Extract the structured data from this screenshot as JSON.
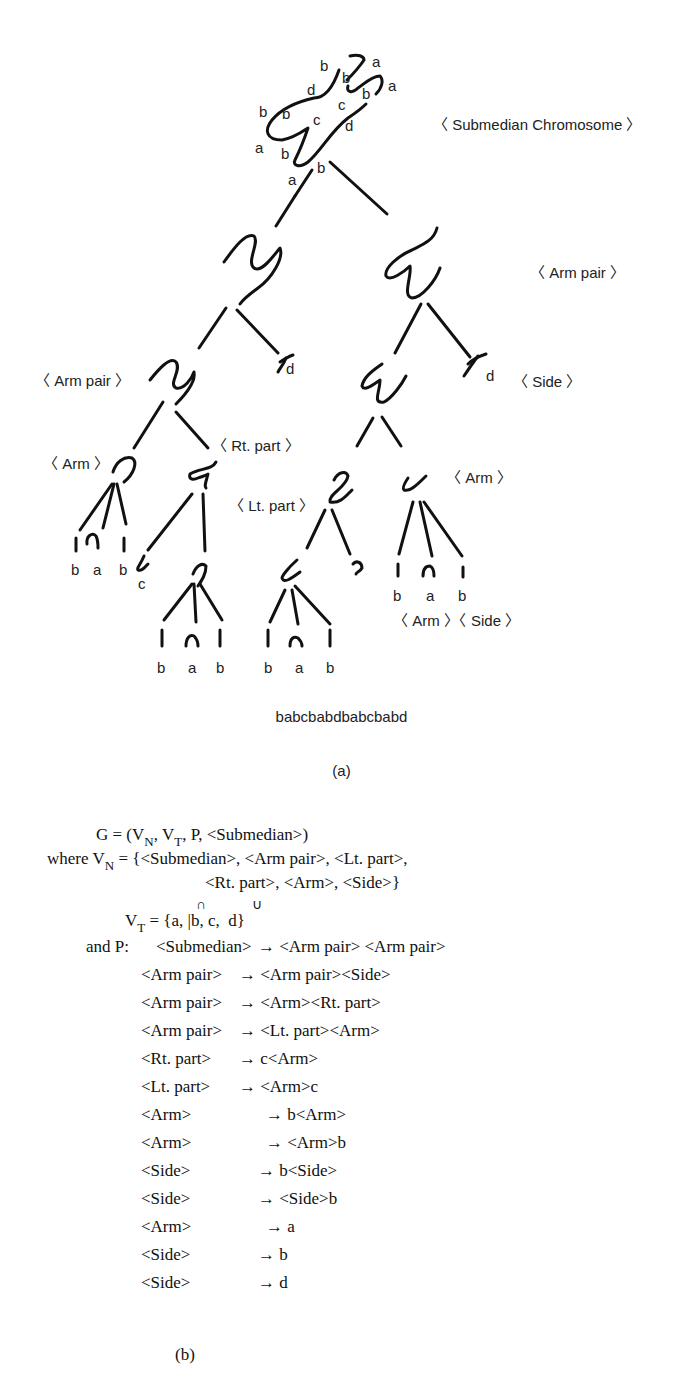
{
  "figure_a": {
    "caption": "(a)",
    "chromosome_labels": {
      "top": [
        "b",
        "b",
        "a",
        "a",
        "d",
        "c",
        "b",
        "b",
        "c",
        "d",
        "b",
        "a",
        "b",
        "a",
        "b"
      ]
    },
    "nodes": {
      "root": "〈 Submedian Chromosome 〉",
      "arm_pair_right": "〈 Arm pair 〉",
      "arm_pair_left": "〈 Arm pair 〉",
      "side_right": "〈 Side 〉",
      "rt_part": "〈 Rt. part 〉",
      "arm_left": "〈 Arm 〉",
      "lt_part": "〈 Lt. part 〉",
      "arm_right": "〈 Arm 〉",
      "arm_side_bottom": "〈 Arm 〉〈 Side 〉"
    },
    "leaves": {
      "d_left": "d",
      "d_right": "d",
      "arm_left_leaves": [
        "b",
        "a",
        "b"
      ],
      "c_left": "c",
      "rt_arm_leaves": [
        "b",
        "a",
        "b"
      ],
      "lt_arm_leaves": [
        "b",
        "a",
        "b"
      ],
      "arm_right_leaves": [
        "b",
        "a",
        "b"
      ]
    },
    "string": "babcbabdbabcbabd"
  },
  "figure_b": {
    "caption": "(b)",
    "line1": "G = (V",
    "line1_sub_n": "N",
    "line1_mid": ", V",
    "line1_sub_t": "T",
    "line1_end": ", P, <Submedian>)",
    "line2_a": "where V",
    "line2_sub": "N",
    "line2_b": " = {<Submedian>, <Arm pair>, <Lt. part>,",
    "line3": "<Rt. part>, <Arm>, <Side>}",
    "cap_symbol": "∩",
    "cup_symbol": "∪",
    "line4_a": "V",
    "line4_sub": "T",
    "line4_b": " = {a, |b, c,  d}",
    "line5_a": "and P:",
    "productions": [
      {
        "lhs": "<Submedian>",
        "rhs": "→ <Arm pair> <Arm pair>"
      },
      {
        "lhs": "<Arm pair>",
        "rhs": "→ <Arm pair><Side>"
      },
      {
        "lhs": "<Arm pair>",
        "rhs": "→ <Arm><Rt. part>"
      },
      {
        "lhs": "<Arm pair>",
        "rhs": "→ <Lt. part><Arm>"
      },
      {
        "lhs": "<Rt. part>",
        "rhs": "→ c<Arm>"
      },
      {
        "lhs": "<Lt. part>",
        "rhs": "→ <Arm>c"
      },
      {
        "lhs": "<Arm>",
        "rhs": "→ b<Arm>"
      },
      {
        "lhs": "<Arm>",
        "rhs": "→ <Arm>b"
      },
      {
        "lhs": "<Side>",
        "rhs": "→ b<Side>"
      },
      {
        "lhs": "<Side>",
        "rhs": "→ <Side>b"
      },
      {
        "lhs": "<Arm>",
        "rhs": "→ a"
      },
      {
        "lhs": "<Side>",
        "rhs": "→ b"
      },
      {
        "lhs": "<Side>",
        "rhs": "→ d"
      }
    ]
  }
}
